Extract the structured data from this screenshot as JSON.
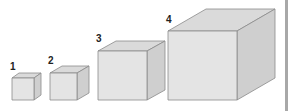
{
  "colors": {
    "front": "#e4e4e4",
    "top": "#dadada",
    "side": "#cfcfcf",
    "stroke": "#8a8a8a",
    "edge_bar": "#a8a8a8"
  },
  "cubes": [
    {
      "label": "1",
      "x": 12,
      "y": 78,
      "size": 22,
      "dx": 7,
      "dy": 5,
      "label_x": 10,
      "label_y": 61
    },
    {
      "label": "2",
      "x": 50,
      "y": 73,
      "size": 27,
      "dx": 12,
      "dy": 7,
      "label_x": 48,
      "label_y": 55
    },
    {
      "label": "3",
      "x": 98,
      "y": 51,
      "size": 49,
      "dx": 18,
      "dy": 10,
      "label_x": 96,
      "label_y": 33
    },
    {
      "label": "4",
      "x": 168,
      "y": 31,
      "size": 69,
      "dx": 38,
      "dy": 22,
      "label_x": 166,
      "label_y": 14
    }
  ]
}
